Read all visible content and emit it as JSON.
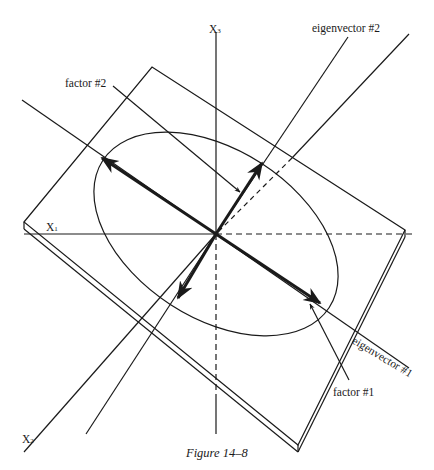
{
  "figure": {
    "caption": "Figure 14–8",
    "colors": {
      "ink": "#1a1a1a",
      "background": "#ffffff"
    }
  },
  "axes": {
    "x1": {
      "label": "X",
      "subscript": "1"
    },
    "x2": {
      "label": "X",
      "subscript": "2"
    },
    "x3": {
      "label": "X",
      "subscript": "3"
    }
  },
  "labels": {
    "eigenvector_1": "eigenvector #1",
    "eigenvector_2": "eigenvector #2",
    "factor_1": "factor #1",
    "factor_2": "factor #2"
  }
}
